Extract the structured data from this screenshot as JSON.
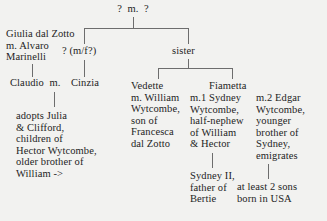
{
  "diagram": {
    "background_color": "#f2f2f0",
    "line_color": "#6d6d6d",
    "text_color": "#242424",
    "nodes": {
      "root": "?  m.  ?",
      "left_spouse_pair": "Giulia dal Zotto\nm. Alvaro\nMarinelli",
      "unknown_child": "? (m/f?)",
      "sister": "sister",
      "claudio": "Claudio  m.",
      "cinzia": "Cinzia",
      "claudio_note": "adopts Julia\n& Clifford,\nchildren of\nHector Wytcombe,\nolder brother of\nWilliam ->",
      "vedette": "Vedette\nm. William\nWytcombe,\nson of\nFrancesca\ndal Zotto",
      "fiametta": "Fiametta",
      "fiametta_m1": "m.1 Sydney\nWytcombe,\nhalf-nephew\nof William\n& Hector",
      "fiametta_m2": "m.2 Edgar\nWytcombe,\nyounger\nbrother of\nSydney,\nemigrates",
      "sydney_ii": "Sydney II,\nfather of\nBertie",
      "usa_sons": "at least 2 sons\nborn in USA"
    }
  }
}
